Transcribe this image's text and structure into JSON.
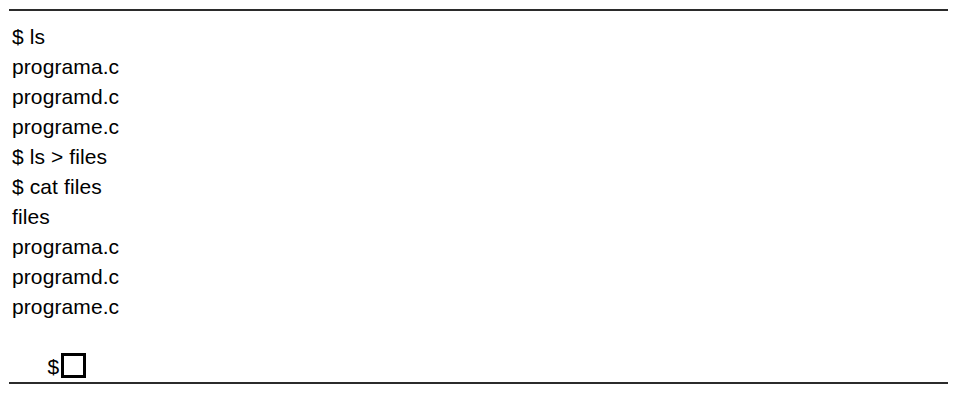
{
  "figure": {
    "type": "terminal-transcript",
    "background_color": "#ffffff",
    "text_color": "#000000",
    "rule_color": "#2b2b2b"
  },
  "rules": {
    "top_label": "top-horizontal-rule",
    "bottom_label": "bottom-horizontal-rule"
  },
  "terminal": {
    "prompt_symbol": "$",
    "lines": [
      {
        "text": "$ ls",
        "kind": "command"
      },
      {
        "text": "programa.c",
        "kind": "output"
      },
      {
        "text": "programd.c",
        "kind": "output"
      },
      {
        "text": "programe.c",
        "kind": "output"
      },
      {
        "text": "$ ls > files",
        "kind": "command"
      },
      {
        "text": "$ cat files",
        "kind": "command"
      },
      {
        "text": "files",
        "kind": "output"
      },
      {
        "text": "programa.c",
        "kind": "output"
      },
      {
        "text": "programd.c",
        "kind": "output"
      },
      {
        "text": "programe.c",
        "kind": "output"
      },
      {
        "text": "$",
        "kind": "prompt-with-cursor"
      }
    ],
    "cursor": {
      "name": "block-cursor",
      "shape": "hollow-square"
    }
  }
}
